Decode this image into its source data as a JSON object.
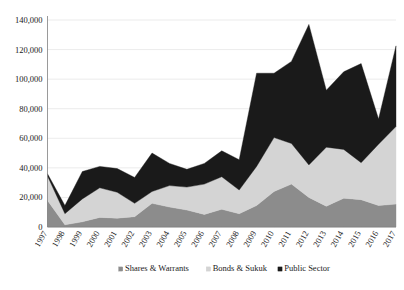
{
  "chart_data": {
    "type": "area",
    "stacked": true,
    "title": "",
    "subtitle": "",
    "xlabel": "",
    "ylabel": "",
    "ylim": [
      0,
      140000
    ],
    "ytick_step": 20000,
    "grid": true,
    "legend_position": "bottom",
    "categories": [
      "1997",
      "1998",
      "1999",
      "2000",
      "2001",
      "2002",
      "2003",
      "2004",
      "2005",
      "2006",
      "2007",
      "2008",
      "2009",
      "2010",
      "2011",
      "2012",
      "2013",
      "2014",
      "2015",
      "2016",
      "2017"
    ],
    "ytick_labels": [
      "0",
      "20,000",
      "40,000",
      "60,000",
      "80,000",
      "100,000",
      "120,000",
      "140,000"
    ],
    "ytick_values": [
      0,
      20000,
      40000,
      60000,
      80000,
      100000,
      120000,
      140000
    ],
    "series": [
      {
        "name": "Shares & Warrants",
        "color": "#8c8c8c",
        "values": [
          18000,
          1500,
          3500,
          6500,
          6000,
          7000,
          16000,
          13500,
          11500,
          8500,
          12000,
          9000,
          14500,
          24000,
          29000,
          20000,
          14000,
          19500,
          18500,
          14500,
          15500
        ]
      },
      {
        "name": "Bonds & Sukuk",
        "color": "#d4d4d4",
        "values": [
          16500,
          7500,
          15500,
          20000,
          17500,
          9000,
          8000,
          14500,
          15500,
          20500,
          22000,
          16000,
          26500,
          36500,
          27500,
          22000,
          40000,
          33000,
          25000,
          41500,
          52500
        ]
      },
      {
        "name": "Public Sector",
        "color": "#1a1a1a",
        "values": [
          1500,
          5500,
          18500,
          14500,
          16000,
          17500,
          26000,
          15000,
          12000,
          14000,
          17500,
          20500,
          63000,
          43500,
          55500,
          95000,
          38500,
          52500,
          67000,
          17000,
          54500
        ]
      }
    ],
    "legend": [
      {
        "label": "Shares & Warrants",
        "color": "#8c8c8c",
        "marker": "square"
      },
      {
        "label": "Bonds & Sukuk",
        "color": "#d4d4d4",
        "marker": "square"
      },
      {
        "label": "Public Sector",
        "color": "#1a1a1a",
        "marker": "square"
      }
    ]
  }
}
